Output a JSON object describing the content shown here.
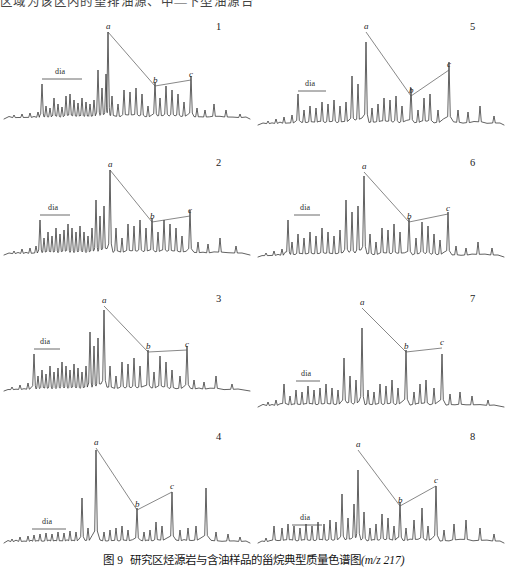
{
  "header": {
    "clipped_text_top": "区域为该区内的望排油源、中—下型油源台"
  },
  "caption": {
    "label": "图 9",
    "title": "研究区烃源岩与含油样品的甾烷典型质量色谱图",
    "mz": "(m/z 217)"
  },
  "annotations": {
    "dia_label": "dia",
    "peak_a": "a",
    "peak_b": "b",
    "peak_c": "c"
  },
  "colors": {
    "trace": "#2e2e2e",
    "connector": "#555555",
    "text": "#1a1a1a",
    "background": "#ffffff"
  },
  "panels": [
    {
      "number": "1",
      "column": "left",
      "row": 1
    },
    {
      "number": "2",
      "column": "left",
      "row": 2
    },
    {
      "number": "3",
      "column": "left",
      "row": 3
    },
    {
      "number": "4",
      "column": "left",
      "row": 4
    },
    {
      "number": "5",
      "column": "right",
      "row": 1
    },
    {
      "number": "6",
      "column": "right",
      "row": 2
    },
    {
      "number": "7",
      "column": "right",
      "row": 3
    },
    {
      "number": "8",
      "column": "right",
      "row": 4
    }
  ],
  "chart_data": {
    "type": "line",
    "xlabel": "",
    "ylabel": "",
    "grid": false,
    "legend": "none",
    "n_panels": 8,
    "panel_layout": "2 columns x 4 rows",
    "series_note": "Each panel is one GC-MS sterane mass chromatogram (m/z 217); x = retention time (unlabeled), y = relative abundance (unlabeled). Peak markers a, b, c are joined by straight annotation lines; 'dia' marks the diasterane region with a horizontal bracket.",
    "panels": [
      {
        "name": "1",
        "markers": {
          "a": {
            "x": 108,
            "y": 14
          },
          "b": {
            "x": 155,
            "y": 68
          },
          "c": {
            "x": 191,
            "y": 62
          }
        },
        "dia_bracket": {
          "x0": 42,
          "x1": 82,
          "y": 62
        },
        "baseline_y": 104,
        "peaks_x": [
          14,
          22,
          30,
          38,
          42,
          46,
          50,
          54,
          58,
          62,
          66,
          70,
          74,
          78,
          82,
          86,
          90,
          94,
          98,
          102,
          106,
          108,
          112,
          118,
          124,
          130,
          136,
          142,
          148,
          155,
          160,
          166,
          172,
          178,
          184,
          191,
          197,
          205,
          214,
          226,
          240
        ],
        "peaks_h": [
          3,
          4,
          5,
          6,
          34,
          12,
          10,
          20,
          14,
          11,
          22,
          24,
          18,
          15,
          20,
          16,
          14,
          18,
          48,
          30,
          44,
          86,
          22,
          14,
          28,
          26,
          30,
          24,
          12,
          36,
          20,
          32,
          28,
          24,
          16,
          42,
          10,
          8,
          14,
          8,
          4
        ]
      },
      {
        "name": "2",
        "markers": {
          "a": {
            "x": 110,
            "y": 16
          },
          "b": {
            "x": 152,
            "y": 68
          },
          "c": {
            "x": 190,
            "y": 62
          }
        },
        "dia_bracket": {
          "x0": 40,
          "x1": 70,
          "y": 62
        },
        "baseline_y": 104,
        "peaks_x": [
          14,
          22,
          30,
          36,
          40,
          44,
          48,
          52,
          56,
          60,
          64,
          68,
          72,
          76,
          80,
          84,
          88,
          92,
          96,
          100,
          104,
          110,
          116,
          122,
          128,
          134,
          140,
          146,
          152,
          158,
          164,
          170,
          176,
          182,
          190,
          198,
          208,
          220,
          236
        ],
        "peaks_h": [
          3,
          5,
          6,
          8,
          34,
          16,
          22,
          18,
          26,
          20,
          24,
          30,
          26,
          22,
          28,
          22,
          18,
          26,
          54,
          38,
          48,
          84,
          26,
          16,
          30,
          28,
          34,
          26,
          36,
          22,
          34,
          30,
          26,
          18,
          44,
          12,
          10,
          16,
          8
        ]
      },
      {
        "name": "3",
        "markers": {
          "a": {
            "x": 104,
            "y": 16
          },
          "b": {
            "x": 148,
            "y": 62
          },
          "c": {
            "x": 187,
            "y": 60
          }
        },
        "dia_bracket": {
          "x0": 34,
          "x1": 60,
          "y": 60
        },
        "baseline_y": 104,
        "peaks_x": [
          12,
          20,
          28,
          34,
          38,
          42,
          46,
          50,
          54,
          58,
          62,
          66,
          70,
          74,
          78,
          82,
          86,
          90,
          94,
          98,
          104,
          110,
          116,
          122,
          128,
          134,
          140,
          148,
          154,
          160,
          166,
          172,
          180,
          187,
          194,
          204,
          216,
          232
        ],
        "peaks_h": [
          3,
          5,
          7,
          36,
          14,
          20,
          16,
          24,
          18,
          22,
          28,
          24,
          20,
          26,
          22,
          18,
          24,
          58,
          44,
          52,
          80,
          24,
          14,
          28,
          26,
          32,
          24,
          40,
          18,
          34,
          28,
          20,
          14,
          44,
          10,
          8,
          14,
          6
        ]
      },
      {
        "name": "4",
        "markers": {
          "a": {
            "x": 96,
            "y": 20
          },
          "b": {
            "x": 137,
            "y": 82
          },
          "c": {
            "x": 172,
            "y": 64
          }
        },
        "dia_bracket": {
          "x0": 32,
          "x1": 66,
          "y": 102
        },
        "baseline_y": 118,
        "peaks_x": [
          12,
          20,
          28,
          34,
          40,
          46,
          52,
          58,
          64,
          70,
          76,
          82,
          88,
          96,
          104,
          110,
          116,
          122,
          128,
          137,
          144,
          150,
          156,
          162,
          172,
          180,
          188,
          196,
          206,
          216,
          228,
          240
        ],
        "peaks_h": [
          3,
          5,
          6,
          7,
          8,
          9,
          8,
          10,
          9,
          11,
          10,
          44,
          14,
          92,
          10,
          12,
          14,
          16,
          12,
          34,
          10,
          12,
          20,
          16,
          50,
          12,
          14,
          16,
          54,
          10,
          8,
          5
        ]
      },
      {
        "name": "5",
        "markers": {
          "a": {
            "x": 112,
            "y": 14
          },
          "b": {
            "x": 157,
            "y": 78
          },
          "c": {
            "x": 195,
            "y": 52
          }
        },
        "dia_bracket": {
          "x0": 44,
          "x1": 72,
          "y": 74
        },
        "baseline_y": 110,
        "peaks_x": [
          14,
          22,
          30,
          38,
          44,
          50,
          56,
          62,
          68,
          74,
          80,
          86,
          92,
          98,
          104,
          112,
          118,
          124,
          130,
          136,
          142,
          148,
          157,
          164,
          170,
          176,
          184,
          195,
          204,
          214,
          226,
          240
        ],
        "peaks_h": [
          3,
          5,
          7,
          9,
          30,
          14,
          18,
          16,
          22,
          20,
          24,
          18,
          22,
          48,
          40,
          82,
          16,
          20,
          26,
          24,
          28,
          18,
          36,
          14,
          26,
          30,
          14,
          62,
          14,
          12,
          18,
          8
        ]
      },
      {
        "name": "6",
        "markers": {
          "a": {
            "x": 110,
            "y": 18
          },
          "b": {
            "x": 155,
            "y": 68
          },
          "c": {
            "x": 194,
            "y": 60
          }
        },
        "dia_bracket": {
          "x0": 40,
          "x1": 66,
          "y": 62
        },
        "baseline_y": 106,
        "peaks_x": [
          12,
          20,
          28,
          34,
          38,
          44,
          50,
          56,
          62,
          68,
          74,
          80,
          86,
          92,
          98,
          104,
          110,
          116,
          122,
          128,
          134,
          140,
          146,
          155,
          162,
          168,
          174,
          180,
          186,
          194,
          202,
          212,
          224,
          238
        ],
        "peaks_h": [
          3,
          5,
          7,
          36,
          14,
          22,
          18,
          24,
          20,
          28,
          24,
          20,
          26,
          56,
          44,
          50,
          80,
          22,
          14,
          28,
          26,
          32,
          24,
          38,
          18,
          34,
          30,
          22,
          16,
          44,
          10,
          8,
          14,
          8
        ]
      },
      {
        "name": "7",
        "markers": {
          "a": {
            "x": 108,
            "y": 18
          },
          "b": {
            "x": 152,
            "y": 62
          },
          "c": {
            "x": 188,
            "y": 58
          }
        },
        "dia_bracket": {
          "x0": 42,
          "x1": 66,
          "y": 92
        },
        "baseline_y": 120,
        "peaks_x": [
          14,
          22,
          30,
          36,
          42,
          48,
          54,
          60,
          66,
          72,
          78,
          84,
          90,
          96,
          102,
          108,
          114,
          120,
          126,
          132,
          138,
          144,
          152,
          160,
          166,
          172,
          180,
          188,
          196,
          206,
          218,
          234
        ],
        "peaks_h": [
          4,
          6,
          22,
          10,
          16,
          14,
          20,
          16,
          18,
          22,
          18,
          16,
          48,
          30,
          26,
          78,
          16,
          14,
          22,
          20,
          26,
          18,
          56,
          14,
          22,
          26,
          18,
          52,
          12,
          14,
          10,
          6
        ]
      },
      {
        "name": "8",
        "markers": {
          "a": {
            "x": 104,
            "y": 22
          },
          "b": {
            "x": 146,
            "y": 78
          },
          "c": {
            "x": 182,
            "y": 58
          }
        },
        "dia_bracket": {
          "x0": 38,
          "x1": 68,
          "y": 98
        },
        "baseline_y": 118,
        "peaks_x": [
          12,
          20,
          28,
          34,
          40,
          46,
          52,
          58,
          64,
          70,
          76,
          82,
          88,
          94,
          100,
          104,
          110,
          116,
          122,
          128,
          134,
          140,
          146,
          152,
          160,
          168,
          174,
          182,
          190,
          200,
          212,
          226,
          240
        ],
        "peaks_h": [
          4,
          16,
          14,
          18,
          16,
          14,
          18,
          16,
          20,
          18,
          22,
          20,
          48,
          24,
          38,
          72,
          30,
          14,
          18,
          28,
          24,
          16,
          40,
          14,
          22,
          34,
          16,
          56,
          12,
          18,
          22,
          14,
          8
        ]
      }
    ]
  }
}
